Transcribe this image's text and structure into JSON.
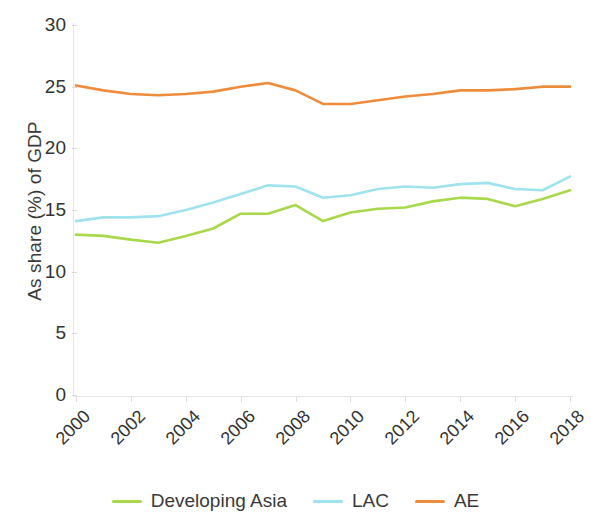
{
  "chart_data": {
    "type": "line",
    "title": "",
    "xlabel": "",
    "ylabel": "As share (%) of GDP",
    "x": [
      2000,
      2001,
      2002,
      2003,
      2004,
      2005,
      2006,
      2007,
      2008,
      2009,
      2010,
      2011,
      2012,
      2013,
      2014,
      2015,
      2016,
      2017,
      2018
    ],
    "xlim": [
      2000,
      2018
    ],
    "ylim": [
      0,
      30
    ],
    "yticks": [
      0,
      5,
      10,
      15,
      20,
      25,
      30
    ],
    "xticks": [
      "2000",
      "2002",
      "2004",
      "2006",
      "2008",
      "2010",
      "2012",
      "2014",
      "2016",
      "2018"
    ],
    "grid": false,
    "legend_position": "bottom",
    "series": [
      {
        "name": "Developing Asia",
        "color": "#a8d94b",
        "values": [
          13.0,
          12.9,
          12.6,
          12.35,
          12.9,
          13.5,
          14.7,
          14.7,
          15.4,
          14.1,
          14.8,
          15.1,
          15.2,
          15.7,
          16.0,
          15.9,
          15.3,
          15.9,
          16.6
        ]
      },
      {
        "name": "LAC",
        "color": "#9fe3ee",
        "values": [
          14.1,
          14.4,
          14.4,
          14.5,
          15.0,
          15.6,
          16.3,
          17.0,
          16.9,
          16.0,
          16.2,
          16.7,
          16.9,
          16.8,
          17.1,
          17.2,
          16.7,
          16.6,
          17.7
        ]
      },
      {
        "name": "AE",
        "color": "#ef8c3c",
        "values": [
          25.1,
          24.7,
          24.4,
          24.3,
          24.4,
          24.6,
          25.0,
          25.3,
          24.7,
          23.6,
          23.6,
          23.9,
          24.2,
          24.4,
          24.7,
          24.7,
          24.8,
          25.0,
          25.0
        ]
      }
    ]
  }
}
